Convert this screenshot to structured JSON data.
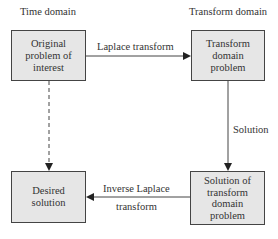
{
  "headers": {
    "left": "Time domain",
    "right": "Transform domain"
  },
  "boxes": {
    "original": [
      "Original",
      "problem of",
      "interest"
    ],
    "transform_problem": [
      "Transform",
      "domain",
      "problem"
    ],
    "desired": [
      "Desired",
      "solution"
    ],
    "transform_solution": [
      "Solution of",
      "transform",
      "domain",
      "problem"
    ]
  },
  "arrows": {
    "laplace": "Laplace transform",
    "solution": "Solution",
    "inverse_line1": "Inverse Laplace",
    "inverse_line2": "transform"
  }
}
